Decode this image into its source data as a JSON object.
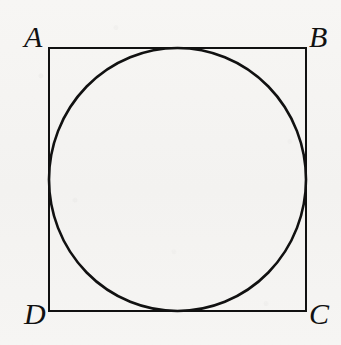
{
  "figure": {
    "caption": "",
    "background_color": "#f5f4f2",
    "ink_color": "#111111",
    "square": {
      "name": "ABCD",
      "x": 49,
      "y": 48,
      "width": 257,
      "height": 263,
      "stroke_width": 2,
      "stroke_color": "#111111",
      "fill": "none"
    },
    "circle": {
      "cx": 177.5,
      "cy": 179.5,
      "r": 128,
      "stroke_width": 2.6,
      "stroke_color": "#111111",
      "fill": "none"
    },
    "labels": [
      {
        "id": "A",
        "text": "A",
        "position": "top-left",
        "x": 24,
        "y": 22
      },
      {
        "id": "B",
        "text": "B",
        "position": "top-right",
        "x": 309,
        "y": 22
      },
      {
        "id": "C",
        "text": "C",
        "position": "bottom-right",
        "x": 309,
        "y": 299
      },
      {
        "id": "D",
        "text": "D",
        "position": "bottom-left",
        "x": 24,
        "y": 299
      }
    ]
  }
}
